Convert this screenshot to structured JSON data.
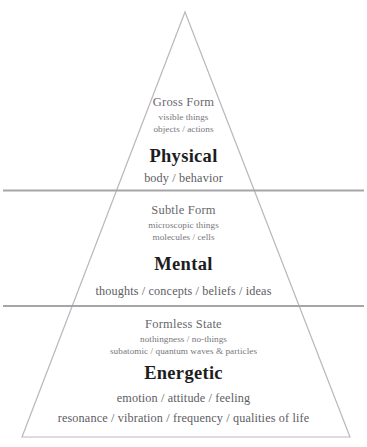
{
  "diagram": {
    "shape": "pyramid",
    "colors": {
      "outline": "#b9b9bd",
      "divider": "#a6a6aa",
      "heading": "#1d1d1f",
      "subheading": "#68686d",
      "detail": "#77777c",
      "background": "#ffffff"
    },
    "layers": [
      {
        "id": "physical",
        "sub_head": "Gross Form",
        "sub_detail_1": "visible things",
        "sub_detail_2": "objects / actions",
        "main_head": "Physical",
        "main_line_1": "body / behavior"
      },
      {
        "id": "mental",
        "sub_head": "Subtle Form",
        "sub_detail_1": "microscopic things",
        "sub_detail_2": "molecules / cells",
        "main_head": "Mental",
        "main_line_1": "thoughts / concepts / beliefs / ideas"
      },
      {
        "id": "energetic",
        "sub_head": "Formless State",
        "sub_detail_1": "nothingness / no-things",
        "sub_detail_2": "subatomic / quantum waves & particles",
        "main_head": "Energetic",
        "main_line_1": "emotion / attitude / feeling",
        "main_line_2": "resonance / vibration / frequency / qualities of life"
      }
    ]
  }
}
